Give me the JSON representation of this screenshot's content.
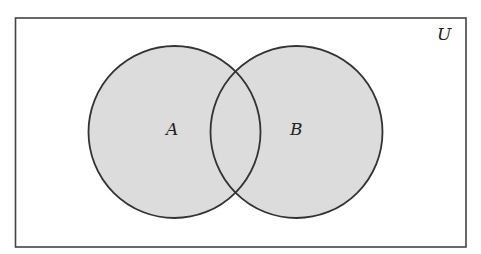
{
  "diagram": {
    "type": "venn",
    "universe": {
      "label": "U",
      "x": 15.5,
      "y": 18,
      "width": 450.5,
      "height": 229
    },
    "sets": [
      {
        "label": "A",
        "cx": 174.5,
        "cy": 132,
        "r": 86
      },
      {
        "label": "B",
        "cx": 296.5,
        "cy": 132,
        "r": 86
      }
    ],
    "shaded_region": "A ∪ B",
    "colors": {
      "fill": "#dcdcdc",
      "stroke": "#333333",
      "border": "#444444",
      "background": "#ffffff"
    }
  }
}
